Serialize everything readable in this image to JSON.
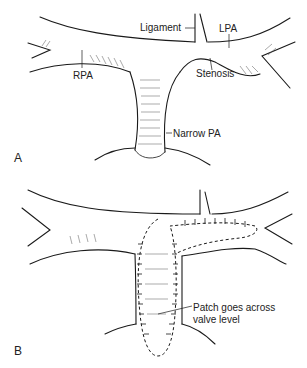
{
  "panels": [
    {
      "id": "A",
      "letter": "A",
      "labels": {
        "ligament": "Ligament",
        "lpa": "LPA",
        "rpa": "RPA",
        "stenosis": "Stenosis",
        "narrow_pa": "Narrow PA"
      }
    },
    {
      "id": "B",
      "letter": "B",
      "labels": {
        "patch_line1": "Patch goes across",
        "patch_line2": "valve level"
      }
    }
  ],
  "colors": {
    "stroke": "#1a1a1a",
    "hatch": "#555555",
    "text": "#222222",
    "background": "#ffffff"
  }
}
